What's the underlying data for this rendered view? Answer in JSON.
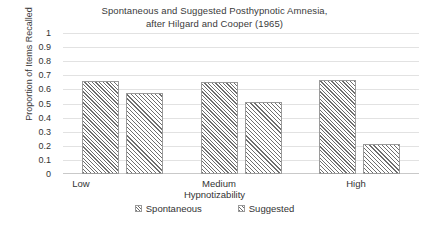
{
  "chart_data": {
    "type": "bar",
    "title": "Spontaneous and Suggested Posthypnotic Amnesia, after Hilgard and Cooper (1965)",
    "title_lines": [
      "Spontaneous and Suggested Posthypnotic Amnesia,",
      "after Hilgard and Cooper (1965)"
    ],
    "subtitle": "",
    "xlabel": "Hypnotizability",
    "ylabel": "Proportion of Items Recalled",
    "categories": [
      "Low",
      "Medium",
      "High"
    ],
    "series": [
      {
        "name": "Spontaneous",
        "values": [
          0.66,
          0.65,
          0.67
        ]
      },
      {
        "name": "Suggested",
        "values": [
          0.575,
          0.51,
          0.21
        ]
      }
    ],
    "ylim": [
      0,
      1
    ],
    "ytick_labels": [
      "1",
      "0.9",
      "0.8",
      "0.7",
      "0.6",
      "0.5",
      "0.4",
      "0.3",
      "0.2",
      "0.1",
      "0"
    ],
    "ytick_values": [
      1,
      0.9,
      0.8,
      0.7,
      0.6,
      0.5,
      0.4,
      0.3,
      0.2,
      0.1,
      0
    ],
    "grid": "horizontal",
    "legend_position": "bottom",
    "colors": {
      "background": "#ffffff",
      "gridline": "#e2e2e2",
      "axis": "#c9c9c9",
      "bar_outline": "#9a9a9a",
      "hatch": "#6e6e6e",
      "text": "#333333"
    }
  }
}
